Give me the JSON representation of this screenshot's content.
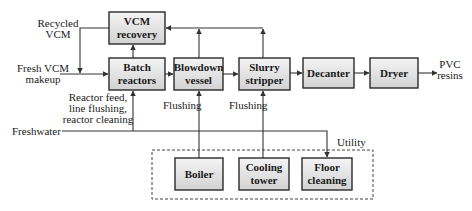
{
  "diagram": {
    "type": "process-flow",
    "nodes": {
      "vcm_recovery": [
        "VCM",
        "recovery"
      ],
      "batch_reactors": [
        "Batch",
        "reactors"
      ],
      "blowdown_vessel": [
        "Blowdown",
        "vessel"
      ],
      "slurry_stripper": [
        "Slurry",
        "stripper"
      ],
      "decanter": [
        "Decanter"
      ],
      "dryer": [
        "Dryer"
      ],
      "boiler": [
        "Boiler"
      ],
      "cooling_tower": [
        "Cooling",
        "tower"
      ],
      "floor_cleaning": [
        "Floor",
        "cleaning"
      ]
    },
    "labels": {
      "recycled_vcm": [
        "Recycled",
        "VCM"
      ],
      "fresh_vcm": [
        "Fresh VCM",
        "makeup"
      ],
      "reactor_feed": [
        "Reactor feed,",
        "line flushing,",
        "reactor cleaning"
      ],
      "flushing_1": "Flushing",
      "flushing_2": "Flushing",
      "freshwater": "Freshwater",
      "pvc_resins": [
        "PVC",
        "resins"
      ],
      "utility": "Utility"
    },
    "edges": [
      {
        "from": "Fresh VCM makeup",
        "to": "Batch reactors"
      },
      {
        "from": "VCM recovery",
        "to": "Batch reactors",
        "label": "Recycled VCM"
      },
      {
        "from": "Batch reactors",
        "to": "VCM recovery"
      },
      {
        "from": "Batch reactors",
        "to": "Blowdown vessel"
      },
      {
        "from": "Blowdown vessel",
        "to": "VCM recovery"
      },
      {
        "from": "Blowdown vessel",
        "to": "Slurry stripper"
      },
      {
        "from": "Slurry stripper",
        "to": "VCM recovery"
      },
      {
        "from": "Slurry stripper",
        "to": "Decanter"
      },
      {
        "from": "Decanter",
        "to": "Dryer"
      },
      {
        "from": "Dryer",
        "to": "PVC resins"
      },
      {
        "from": "Freshwater",
        "to": "Batch reactors",
        "label": "Reactor feed, line flushing, reactor cleaning"
      },
      {
        "from": "Boiler",
        "to": "Blowdown vessel",
        "label": "Flushing"
      },
      {
        "from": "Cooling tower",
        "to": "Slurry stripper",
        "label": "Flushing"
      },
      {
        "from": "Freshwater",
        "to": "Floor cleaning"
      }
    ],
    "group": {
      "name": "Utility",
      "members": [
        "Boiler",
        "Cooling tower",
        "Floor cleaning"
      ]
    }
  }
}
